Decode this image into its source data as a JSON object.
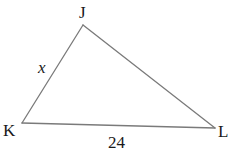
{
  "figure": {
    "type": "triangle",
    "stroke_color": "#7a7a7a",
    "label_color": "#1a1a1a",
    "vertices": {
      "J": {
        "label": "J",
        "x": 83,
        "y": 25
      },
      "K": {
        "label": "K",
        "x": 22,
        "y": 123
      },
      "L": {
        "label": "L",
        "x": 215,
        "y": 128
      }
    },
    "sides": {
      "JK": {
        "label": "x",
        "italic": true
      },
      "KL": {
        "label": "24",
        "italic": false
      },
      "JL": {
        "label": ""
      }
    }
  }
}
